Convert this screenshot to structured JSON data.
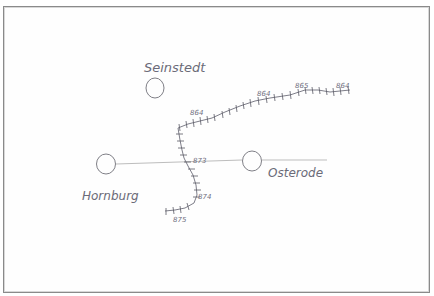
{
  "map": {
    "type": "hand-drawn sketch map",
    "ink_color": "#6b6b78",
    "road_color": "#b8b8b8",
    "towns": [
      {
        "name": "Seinstedt",
        "circle": {
          "cx": 155,
          "cy": 88,
          "r": 9
        },
        "label_pos": {
          "x": 144,
          "y": 72
        }
      },
      {
        "name": "Hornburg",
        "circle": {
          "cx": 106,
          "cy": 164,
          "r": 10
        },
        "label_pos": {
          "x": 82,
          "y": 200
        }
      },
      {
        "name": "Osterode",
        "circle": {
          "cx": 252,
          "cy": 161,
          "r": 10
        },
        "label_pos": {
          "x": 268,
          "y": 177
        }
      }
    ],
    "track_markers": [
      {
        "label": "864",
        "x": 190,
        "y": 115
      },
      {
        "label": "864",
        "x": 257,
        "y": 96
      },
      {
        "label": "865",
        "x": 295,
        "y": 88
      },
      {
        "label": "864",
        "x": 336,
        "y": 88
      },
      {
        "label": "873",
        "x": 193,
        "y": 163
      },
      {
        "label": "874",
        "x": 198,
        "y": 199
      },
      {
        "label": "875",
        "x": 173,
        "y": 222
      }
    ]
  }
}
